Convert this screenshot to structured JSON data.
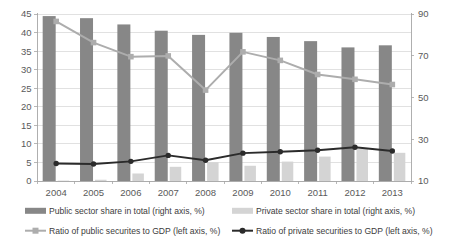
{
  "chart_data": {
    "type": "bar",
    "title": "",
    "xlabel": "",
    "ylabel": "",
    "grid": true,
    "legend_position": "bottom",
    "categories": [
      "2004",
      "2005",
      "2006",
      "2007",
      "2008",
      "2009",
      "2010",
      "2011",
      "2012",
      "2013"
    ],
    "left_axis": {
      "label": "left axis, %",
      "ylim": [
        0,
        45
      ],
      "ticks": [
        0,
        5,
        10,
        15,
        20,
        25,
        30,
        35,
        40,
        45
      ],
      "tick_labels": [
        "0",
        "5",
        "10",
        "15",
        "20",
        "25",
        "30",
        "35",
        "40",
        "45"
      ]
    },
    "right_axis": {
      "label": "right axis, %",
      "ylim": [
        10,
        90
      ],
      "ticks": [
        10,
        30,
        50,
        70,
        90
      ],
      "tick_labels": [
        "10",
        "30",
        "50",
        "70",
        "90"
      ]
    },
    "series": [
      {
        "name": "Public sector share in total (right axis, %)",
        "kind": "bar",
        "axis": "right",
        "color": "#878787",
        "values": [
          89,
          88,
          85,
          82,
          80,
          81,
          79,
          77,
          74,
          75
        ]
      },
      {
        "name": "Private sector share in total (right axis, %)",
        "kind": "bar",
        "axis": "right",
        "color": "#d4d4d4",
        "values": [
          10.2,
          10.6,
          13.6,
          16.8,
          19.0,
          17.3,
          19.3,
          21.7,
          25.4,
          23.5
        ]
      },
      {
        "name": "Ratio of public securites to GDP (left axis, %)",
        "kind": "line",
        "axis": "left",
        "color": "#adadad",
        "values": [
          43.0,
          37.3,
          33.5,
          33.7,
          24.5,
          34.8,
          32.5,
          28.7,
          27.4,
          26.0
        ]
      },
      {
        "name": "Ratio of private securities to GDP (left axis, %)",
        "kind": "line",
        "axis": "left",
        "color": "#2b2b2b",
        "values": [
          4.7,
          4.6,
          5.3,
          6.9,
          5.6,
          7.5,
          7.9,
          8.3,
          9.1,
          8.1
        ]
      }
    ]
  },
  "legend": {
    "items": [
      {
        "label": "Public sector share in total (right axis, %)",
        "marker": "bar-swatch",
        "color": "#878787"
      },
      {
        "label": "Private sector share in total (right axis, %)",
        "marker": "bar-swatch",
        "color": "#d4d4d4"
      },
      {
        "label": "Ratio of public securites to GDP (left axis, %)",
        "marker": "line-marker",
        "color": "#adadad"
      },
      {
        "label": "Ratio of private securities to GDP (left axis, %)",
        "marker": "line-marker",
        "color": "#2b2b2b"
      }
    ]
  },
  "colors": {
    "gridline": "#d9d9d9",
    "axis": "#a6a6a6",
    "tick_label": "#5a5a5a",
    "legend_label": "#3c3c3c",
    "background": "#ffffff"
  }
}
